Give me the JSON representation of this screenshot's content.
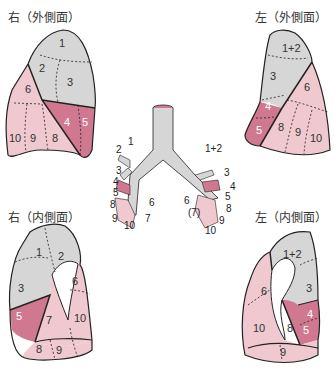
{
  "colors": {
    "upper_lobe": "#d6d6d6",
    "lingula_middle": "#d07890",
    "lower_lobe": "#f0c8d0",
    "outline": "#222222",
    "background": "#ffffff"
  },
  "panels": {
    "right_lateral": {
      "title": "右（外側面）",
      "segments": [
        "1",
        "2",
        "3",
        "6",
        "4",
        "5",
        "10",
        "9",
        "8"
      ]
    },
    "left_lateral": {
      "title": "左（外側面）",
      "segments": [
        "1+2",
        "3",
        "6",
        "4",
        "5",
        "8",
        "9",
        "10"
      ]
    },
    "right_medial": {
      "title": "右（内側面）",
      "segments": [
        "1",
        "2",
        "3",
        "6",
        "5",
        "7",
        "10",
        "8",
        "9"
      ]
    },
    "left_medial": {
      "title": "左（内側面）",
      "segments": [
        "1+2",
        "3",
        "6",
        "4",
        "5",
        "10",
        "8",
        "9"
      ]
    }
  },
  "bronchial_tree": {
    "right_labels": [
      "1",
      "2",
      "3",
      "4",
      "5",
      "8",
      "9",
      "10",
      "7",
      "6"
    ],
    "left_labels": [
      "1+2",
      "3",
      "4",
      "5",
      "8",
      "6",
      "(7)",
      "9",
      "10"
    ]
  }
}
